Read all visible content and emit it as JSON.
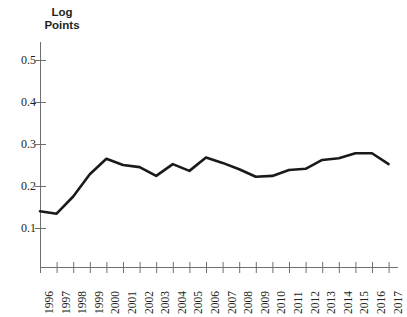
{
  "chart_data": {
    "type": "line",
    "title": "",
    "xlabel": "",
    "ylabel": "Log\nPoints",
    "ylim": [
      0.05,
      0.55
    ],
    "yticks": [
      0.5,
      0.4,
      0.3,
      0.2,
      0.1
    ],
    "ytick_labels": [
      "0.5",
      "0.4",
      "0.3",
      "0.2",
      "0.1"
    ],
    "grid": false,
    "legend": "none",
    "line_color": "#1a1a1a",
    "categories": [
      "1996",
      "1997",
      "1998",
      "1999",
      "2000",
      "2001",
      "2002",
      "2003",
      "2004",
      "2005",
      "2006",
      "2007",
      "2008",
      "2009",
      "2010",
      "2011",
      "2012",
      "2013",
      "2014",
      "2015",
      "2016",
      "2017"
    ],
    "series": [
      {
        "name": "Log Points",
        "values": [
          0.14,
          0.134,
          0.175,
          0.228,
          0.265,
          0.25,
          0.245,
          0.224,
          0.252,
          0.236,
          0.268,
          0.255,
          0.24,
          0.222,
          0.224,
          0.238,
          0.241,
          0.262,
          0.266,
          0.278,
          0.278,
          0.252
        ]
      }
    ]
  },
  "axis": {
    "y_title": "Log\nPoints"
  }
}
